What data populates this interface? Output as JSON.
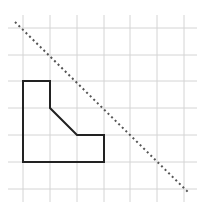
{
  "diagram": {
    "type": "grid-geometry",
    "grid": {
      "columns_x": [
        23,
        50,
        77,
        104,
        130,
        157,
        184
      ],
      "rows_y": [
        28,
        55,
        81,
        108,
        135,
        162,
        189
      ],
      "line_color": "#d4d4d4",
      "extent": {
        "x_min": 8,
        "x_max": 197,
        "y_min": 15,
        "y_max": 202
      }
    },
    "polygon": {
      "points": "23,81 50,81 50,108 77,135 104,135 104,162 23,162",
      "grid_vertices": [
        [
          0,
          2
        ],
        [
          1,
          2
        ],
        [
          1,
          3
        ],
        [
          2,
          4
        ],
        [
          3,
          4
        ],
        [
          3,
          5
        ],
        [
          0,
          5
        ]
      ],
      "stroke": "#222222"
    },
    "reflection_line": {
      "x1": 15,
      "y1": 22,
      "x2": 188,
      "y2": 192,
      "stroke": "#555555",
      "style": "dotted"
    }
  }
}
